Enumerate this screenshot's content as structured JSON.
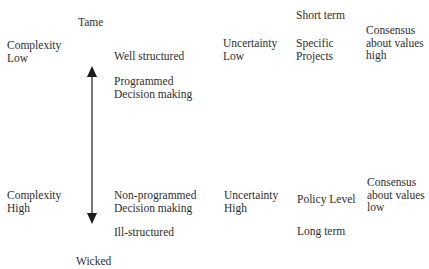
{
  "diagram": {
    "type": "problem-typology-continuum",
    "axis": {
      "top_label": "Tame",
      "bottom_label": "Wicked",
      "arrow": "bidirectional-vertical",
      "color": "#2e2e2e"
    },
    "upper_pole": {
      "complexity": [
        "Complexity",
        "Low"
      ],
      "structure": "Well structured",
      "decision": [
        "Programmed",
        "Decision making"
      ],
      "uncertainty": [
        "Uncertainty",
        "Low"
      ],
      "time_horizon": "Short term",
      "scope": [
        "Specific",
        "Projects"
      ],
      "consensus": [
        "Consensus",
        "about values",
        "high"
      ]
    },
    "lower_pole": {
      "complexity": [
        "Complexity",
        "High"
      ],
      "decision": [
        "Non-programmed",
        "Decision making"
      ],
      "structure": "Ill-structured",
      "uncertainty": [
        "Uncertainty",
        "High"
      ],
      "scope": "Policy Level",
      "time_horizon": "Long term",
      "consensus": [
        "Consensus",
        "about values",
        "low"
      ]
    }
  }
}
